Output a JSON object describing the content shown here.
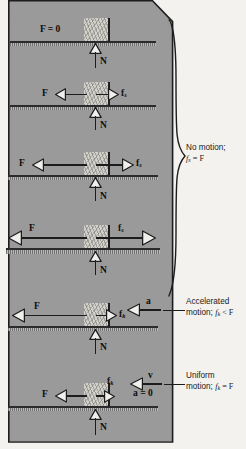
{
  "figure": {
    "panel_color": "#9a9a9a",
    "background_color": "#f3f2ef"
  },
  "scenes": [
    {
      "id": "scene-1-no-applied-force",
      "applied_force_label": "F = 0",
      "normal_label": "N",
      "friction_label": "",
      "has_applied_arrow": false,
      "has_friction_arrow": false
    },
    {
      "id": "scene-2-small-static",
      "applied_force_label": "F",
      "normal_label": "N",
      "friction_label": "f",
      "friction_sub": "s",
      "has_applied_arrow": true,
      "has_friction_arrow": true
    },
    {
      "id": "scene-3-medium-static",
      "applied_force_label": "F",
      "normal_label": "N",
      "friction_label": "f",
      "friction_sub": "s",
      "has_applied_arrow": true,
      "has_friction_arrow": true
    },
    {
      "id": "scene-4-max-static",
      "applied_force_label": "F",
      "normal_label": "N",
      "friction_label": "f",
      "friction_sub": "s",
      "has_applied_arrow": true,
      "has_friction_arrow": true
    },
    {
      "id": "scene-5-kinetic-accelerating",
      "applied_force_label": "F",
      "normal_label": "N",
      "friction_label": "f",
      "friction_sub": "k",
      "motion_symbol": "a",
      "has_applied_arrow": true,
      "has_friction_arrow": true
    },
    {
      "id": "scene-6-kinetic-uniform",
      "applied_force_label": "F",
      "normal_label": "N",
      "friction_label": "f",
      "friction_sub": "k",
      "motion_symbol": "v",
      "motion_secondary": "a = 0",
      "has_applied_arrow": true,
      "has_friction_arrow": true
    }
  ],
  "callouts": [
    {
      "id": "callout-no-motion",
      "line1": "No motion;",
      "line2_f": "f",
      "line2_sub": "s",
      "line2_rest": " = F"
    },
    {
      "id": "callout-accelerated",
      "line1": "Accelerated",
      "line2_pre": "motion; ",
      "line2_f": "f",
      "line2_sub": "k",
      "line2_rest": " < F"
    },
    {
      "id": "callout-uniform",
      "line1": "Uniform",
      "line2_pre": "motion; ",
      "line2_f": "f",
      "line2_sub": "k",
      "line2_rest": " = F"
    }
  ]
}
